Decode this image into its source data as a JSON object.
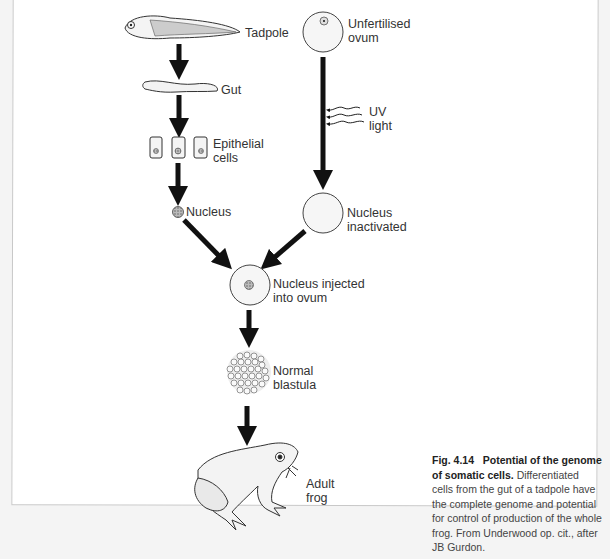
{
  "diagram": {
    "title": "Potential of the genome of somatic cells",
    "nodes": [
      {
        "id": "tadpole",
        "label": "Tadpole"
      },
      {
        "id": "gut",
        "label": "Gut"
      },
      {
        "id": "epithelial",
        "label_line1": "Epithelial",
        "label_line2": "cells"
      },
      {
        "id": "nucleus",
        "label": "Nucleus"
      },
      {
        "id": "ovum",
        "label_line1": "Unfertilised",
        "label_line2": "ovum"
      },
      {
        "id": "uv",
        "label_line1": "UV",
        "label_line2": "light"
      },
      {
        "id": "inactivated",
        "label_line1": "Nucleus",
        "label_line2": "inactivated"
      },
      {
        "id": "injected",
        "label_line1": "Nucleus injected",
        "label_line2": "into ovum"
      },
      {
        "id": "blastula",
        "label_line1": "Normal",
        "label_line2": "blastula"
      },
      {
        "id": "frog",
        "label_line1": "Adult",
        "label_line2": "frog"
      }
    ],
    "edges": [
      [
        "tadpole",
        "gut"
      ],
      [
        "gut",
        "epithelial"
      ],
      [
        "epithelial",
        "nucleus"
      ],
      [
        "nucleus",
        "injected"
      ],
      [
        "ovum",
        "inactivated"
      ],
      [
        "uv",
        "ovum"
      ],
      [
        "inactivated",
        "injected"
      ],
      [
        "injected",
        "blastula"
      ],
      [
        "blastula",
        "frog"
      ]
    ]
  },
  "caption": {
    "fig_number": "Fig. 4.14",
    "bold_title": "Potential of the genome of somatic cells.",
    "text": "Differentiated cells from the gut of a tadpole have the complete genome and potential for control of production of the whole frog. From Underwood op. cit., after JB Gurdon."
  }
}
